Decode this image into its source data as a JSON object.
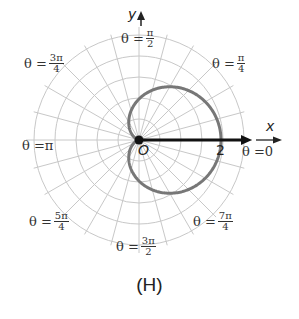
{
  "chart_data": {
    "type": "line",
    "coordinate_system": "polar",
    "title": "",
    "caption": "(H)",
    "equation": "r = 1 + cos θ",
    "curve": {
      "name": "cardioid",
      "r_of_theta": "1 + cos(theta)",
      "theta_range": [
        0,
        6.2832
      ],
      "sample_points": [
        {
          "theta": "0",
          "r": 2
        },
        {
          "theta": "π/4",
          "r": 1.71
        },
        {
          "theta": "π/2",
          "r": 1
        },
        {
          "theta": "3π/4",
          "r": 0.29
        },
        {
          "theta": "π",
          "r": 0
        },
        {
          "theta": "5π/4",
          "r": 0.29
        },
        {
          "theta": "3π/2",
          "r": 1
        },
        {
          "theta": "7π/4",
          "r": 1.71
        }
      ]
    },
    "grid": {
      "rings": 5,
      "radial_spacing_deg": 15,
      "on": true
    },
    "axis_labels": {
      "x": "x",
      "y": "y"
    },
    "origin_label": "O",
    "tick_labels": [
      {
        "r": 2,
        "label": "2"
      }
    ],
    "angle_labels": [
      {
        "angle": "0",
        "prefix": "θ = ",
        "whole": "0"
      },
      {
        "angle": "π/4",
        "prefix": "θ = ",
        "num": "π",
        "den": "4"
      },
      {
        "angle": "π/2",
        "prefix": "θ = ",
        "num": "π",
        "den": "2"
      },
      {
        "angle": "3π/4",
        "prefix": "θ = ",
        "num": "3π",
        "den": "4"
      },
      {
        "angle": "π",
        "prefix": "θ = ",
        "whole": "π"
      },
      {
        "angle": "5π/4",
        "prefix": "θ = ",
        "num": "5π",
        "den": "4"
      },
      {
        "angle": "3π/2",
        "prefix": "θ = ",
        "num": "3π",
        "den": "2"
      },
      {
        "angle": "7π/4",
        "prefix": "θ = ",
        "num": "7π",
        "den": "4"
      }
    ],
    "colors": {
      "grid": "#c8c8c8",
      "curve": "#777777",
      "axis": "#111111"
    }
  }
}
